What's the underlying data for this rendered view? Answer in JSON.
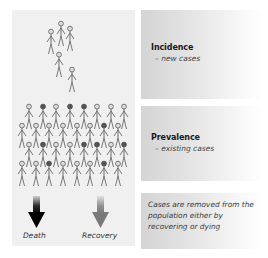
{
  "diagram": {
    "colors": {
      "figure_stroke": "#6a6a6a",
      "figure_head_dark": "#4a4a4a",
      "left_panel_bg": "#f0f0f0",
      "panel_gradient_start": "#d4d4d4",
      "panel_gradient_end": "#ffffff",
      "death_arrow": "#0a0a0a",
      "recovery_arrow": "#7a7a7a"
    },
    "incidence_group": {
      "figure_count": 6,
      "description": "small cluster of new cases"
    },
    "prevalence_group": {
      "rows": 4,
      "figures_per_row": 8,
      "figure_count": 32,
      "description": "large crowd of existing cases"
    },
    "panels": {
      "incidence": {
        "title": "Incidence",
        "subtitle": "– new cases"
      },
      "prevalence": {
        "title": "Prevalence",
        "subtitle": "– existing cases"
      },
      "removal": {
        "text": "Cases are removed from the population either by recovering or dying"
      }
    },
    "arrows": {
      "death": {
        "label": "Death",
        "icon": "down-arrow-black"
      },
      "recovery": {
        "label": "Recovery",
        "icon": "down-arrow-gray"
      }
    }
  }
}
